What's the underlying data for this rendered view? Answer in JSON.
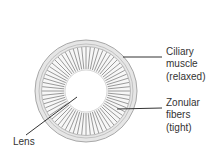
{
  "diagram": {
    "labels": {
      "ciliary": [
        "Ciliary",
        "muscle",
        "(relaxed)"
      ],
      "zonular": [
        "Zonular",
        "fibers",
        "(tight)"
      ],
      "lens": "Lens"
    },
    "colors": {
      "ring_fill": "#e4e4e4",
      "ring_stroke": "#a8a8a8",
      "fiber": "#9a9a9a",
      "leader": "#333333",
      "text": "#333333"
    },
    "geometry": {
      "center": [
        86,
        91
      ],
      "outer_radius": 51,
      "fiber_outer_radius": 44,
      "lens_radius": 21,
      "fiber_count": 64
    }
  }
}
